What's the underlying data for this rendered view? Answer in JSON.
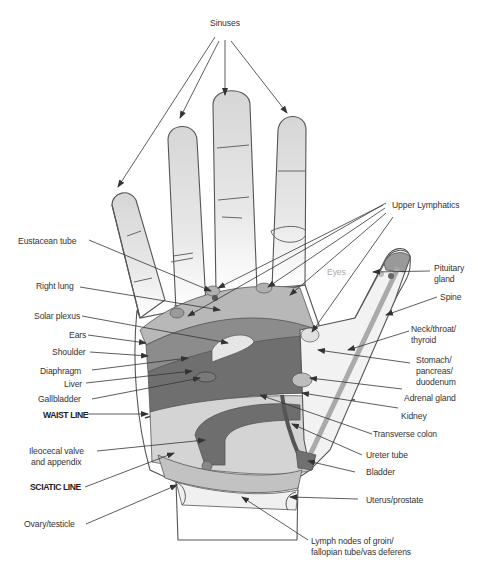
{
  "diagram": {
    "type": "hand reflexology map (palm, right hand)",
    "colors": {
      "outline": "#555555",
      "fingertip_shade": "#dcdcdc",
      "upper_band": "#a8a8a8",
      "lung_band": "#8a8a8a",
      "dark_band": "#6e6e6e",
      "lower_palm": "#d2d2d2",
      "wrist_band": "#c4c4c4",
      "arrow": "#333333",
      "label_text": "#333333",
      "eyes_label": "#aaaaaa"
    },
    "labels": {
      "sinuses": "Sinuses",
      "eustacean_tube": "Eustacean tube",
      "right_lung": "Right lung",
      "solar_plexus": "Solar plexus",
      "ears": "Ears",
      "shoulder": "Shoulder",
      "diaphragm": "Diaphragm",
      "liver": "Liver",
      "gallbladder": "Gallbladder",
      "waist_line": "WAIST LINE",
      "ileocecal_1": "Ileocecal valve",
      "ileocecal_2": "and appendix",
      "sciatic_line": "SCIATIC LINE",
      "ovary_testicle": "Ovary/testicle",
      "upper_lymphatics": "Upper Lymphatics",
      "eyes": "Eyes",
      "pituitary_1": "Pituitary",
      "pituitary_2": "gland",
      "spine": "Spine",
      "neck_1": "Neck/throat/",
      "neck_2": "thyroid",
      "stomach_1": "Stomach/",
      "stomach_2": "pancreas/",
      "stomach_3": "duodenum",
      "adrenal_gland": "Adrenal gland",
      "kidney": "Kidney",
      "transverse_colon": "Transverse colon",
      "ureter_tube": "Ureter tube",
      "bladder": "Bladder",
      "uterus_prostate": "Uterus/prostate",
      "lymph_1": "Lymph nodes of groin/",
      "lymph_2": "fallopian tube/vas deferens"
    }
  }
}
